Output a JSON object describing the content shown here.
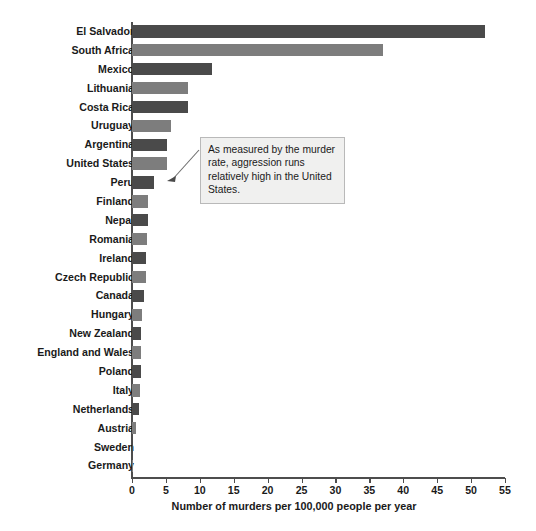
{
  "chart_data": {
    "type": "bar",
    "orientation": "horizontal",
    "title": "",
    "xlabel": "Number of murders per 100,000 people per year",
    "ylabel": "",
    "xlim": [
      0,
      55
    ],
    "xticks": [
      0,
      5,
      10,
      15,
      20,
      25,
      30,
      35,
      40,
      45,
      50,
      55
    ],
    "grid": false,
    "legend": null,
    "categories": [
      "El Salvador",
      "South Africa",
      "Mexico",
      "Lithuania",
      "Costa Rica",
      "Uruguay",
      "Argentina",
      "United States",
      "Peru",
      "Finland",
      "Nepal",
      "Romania",
      "Ireland",
      "Czech Republic",
      "Canada",
      "Hungary",
      "New Zealand",
      "England and Wales",
      "Poland",
      "Italy",
      "Netherlands",
      "Austria",
      "Sweden",
      "Germany"
    ],
    "values": [
      52.0,
      37.0,
      11.8,
      8.3,
      8.2,
      5.8,
      5.1,
      5.2,
      3.2,
      2.4,
      2.3,
      2.2,
      2.1,
      2.1,
      1.8,
      1.5,
      1.4,
      1.3,
      1.3,
      1.2,
      1.1,
      0.6,
      0.2,
      0.2
    ],
    "bar_colors": [
      "#4a4a4a",
      "#7d7d7d",
      "#4a4a4a",
      "#7d7d7d",
      "#4a4a4a",
      "#7d7d7d",
      "#4a4a4a",
      "#7d7d7d",
      "#4a4a4a",
      "#7d7d7d",
      "#4a4a4a",
      "#7d7d7d",
      "#4a4a4a",
      "#7d7d7d",
      "#4a4a4a",
      "#7d7d7d",
      "#4a4a4a",
      "#7d7d7d",
      "#4a4a4a",
      "#7d7d7d",
      "#4a4a4a",
      "#7d7d7d",
      "#4a4a4a",
      "#7d7d7d"
    ],
    "annotations": [
      {
        "text": "As measured by the murder rate, aggression runs relatively high in the United States.",
        "points_to": "United States"
      }
    ]
  },
  "colors": {
    "bar_dark": "#4a4a4a",
    "bar_light": "#7d7d7d",
    "axis": "#4d4d4d",
    "text": "#1a1a1a",
    "annotation_bg": "#f0f0ef",
    "annotation_border": "#b9b9b9",
    "background": "#ffffff"
  }
}
